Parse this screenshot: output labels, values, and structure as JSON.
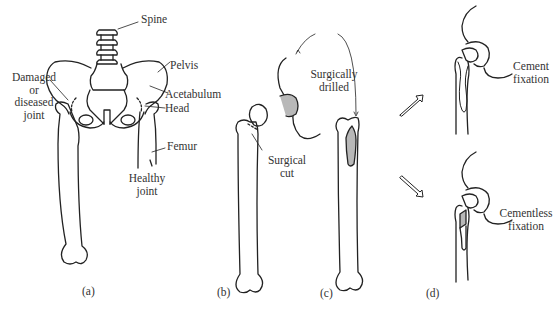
{
  "panels": {
    "a": {
      "caption": "(a)",
      "labels": {
        "spine": "Spine",
        "pelvis": "Pelvis",
        "damaged_1": "Damaged",
        "damaged_2": "or",
        "damaged_3": "diseased",
        "damaged_4": "joint",
        "acetabulum": "Acetabulum",
        "head": "Head",
        "femur": "Femur",
        "healthy_1": "Healthy",
        "healthy_2": "joint"
      }
    },
    "b": {
      "caption": "(b)",
      "labels": {
        "cut_1": "Surgical",
        "cut_2": "cut"
      }
    },
    "c": {
      "caption": "(c)",
      "labels": {
        "drilled_1": "Surgically",
        "drilled_2": "drilled"
      }
    },
    "d": {
      "caption": "(d)",
      "labels": {
        "cement_1": "Cement",
        "cement_2": "fixation",
        "cementless_1": "Cementless",
        "cementless_2": "fixation"
      }
    }
  },
  "colors": {
    "line": "#222222",
    "shade": "#b8b8b8",
    "background": "#ffffff"
  }
}
